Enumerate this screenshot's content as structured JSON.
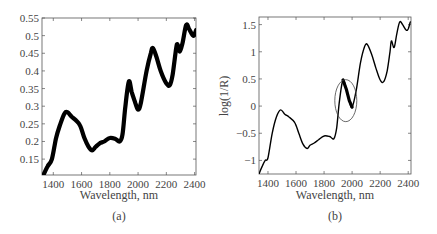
{
  "chart_data": [
    {
      "type": "line",
      "panel": "(a)",
      "title": "",
      "xlabel": "Wavelength, nm",
      "ylabel": "",
      "xlim": [
        1320,
        2410
      ],
      "ylim": [
        0.105,
        0.55
      ],
      "xticks": [
        1400,
        1600,
        1800,
        2000,
        2200,
        2400
      ],
      "yticks": [
        0.15,
        0.2,
        0.25,
        0.3,
        0.35,
        0.4,
        0.45,
        0.5,
        0.55
      ],
      "ytick_labels": [
        "0.15",
        "0.2",
        "0.25",
        "0.3",
        "0.35",
        "0.4",
        "0.45",
        "0.5",
        "0.55"
      ],
      "grid": false,
      "legend": null,
      "series": [
        {
          "name": "spectra (overlaid, many samples)",
          "color": "#000000",
          "band_width": 0.012,
          "x": [
            1330,
            1360,
            1390,
            1420,
            1450,
            1480,
            1500,
            1530,
            1560,
            1590,
            1620,
            1650,
            1675,
            1700,
            1730,
            1760,
            1800,
            1840,
            1870,
            1890,
            1910,
            1935,
            1955,
            1980,
            2000,
            2020,
            2060,
            2090,
            2105,
            2130,
            2160,
            2200,
            2225,
            2245,
            2270,
            2280,
            2295,
            2315,
            2340,
            2360,
            2380,
            2395,
            2410
          ],
          "values": [
            0.105,
            0.13,
            0.15,
            0.21,
            0.25,
            0.28,
            0.283,
            0.27,
            0.26,
            0.245,
            0.21,
            0.185,
            0.175,
            0.185,
            0.195,
            0.2,
            0.21,
            0.207,
            0.2,
            0.22,
            0.3,
            0.37,
            0.34,
            0.31,
            0.29,
            0.31,
            0.4,
            0.45,
            0.465,
            0.44,
            0.4,
            0.365,
            0.36,
            0.39,
            0.465,
            0.475,
            0.455,
            0.48,
            0.53,
            0.52,
            0.505,
            0.5,
            0.515
          ]
        }
      ]
    },
    {
      "type": "line",
      "panel": "(b)",
      "title": "",
      "xlabel": "Wavelength, nm",
      "ylabel": "log(1/R)",
      "xlim": [
        1336,
        2420
      ],
      "ylim": [
        -1.25,
        1.64
      ],
      "xticks": [
        1400,
        1600,
        1800,
        2000,
        2200,
        2400
      ],
      "yticks": [
        -1,
        -0.5,
        0,
        0.5,
        1,
        1.5
      ],
      "ytick_labels": [
        "−1",
        "−0.5",
        "0",
        "0.5",
        "1",
        "1.5"
      ],
      "grid": false,
      "legend": null,
      "annotation": {
        "type": "ellipse",
        "center_wavelength": 1955,
        "center_value": 0.1,
        "note": "highlighted region of spectral variation near 1940 nm"
      },
      "series": [
        {
          "name": "spectra",
          "color": "#000000",
          "x": [
            1336,
            1360,
            1380,
            1400,
            1430,
            1460,
            1490,
            1520,
            1550,
            1590,
            1620,
            1650,
            1680,
            1700,
            1730,
            1760,
            1800,
            1840,
            1870,
            1890,
            1910,
            1935,
            1960,
            1980,
            2000,
            2030,
            2060,
            2090,
            2110,
            2140,
            2170,
            2200,
            2225,
            2250,
            2270,
            2280,
            2300,
            2320,
            2340,
            2360,
            2385,
            2400,
            2415
          ],
          "values": [
            -1.25,
            -1.1,
            -1.0,
            -0.95,
            -0.5,
            -0.2,
            -0.07,
            -0.15,
            -0.2,
            -0.3,
            -0.5,
            -0.7,
            -0.78,
            -0.72,
            -0.68,
            -0.62,
            -0.55,
            -0.56,
            -0.6,
            -0.4,
            0.1,
            0.48,
            0.3,
            0.1,
            -0.02,
            0.3,
            0.8,
            1.1,
            1.13,
            0.95,
            0.7,
            0.48,
            0.45,
            0.65,
            1.0,
            1.2,
            1.08,
            1.35,
            1.55,
            1.5,
            1.4,
            1.42,
            1.55
          ]
        }
      ]
    }
  ],
  "panels": {
    "a": {
      "caption": "(a)",
      "xlabel": "Wavelength, nm"
    },
    "b": {
      "caption": "(b)",
      "xlabel": "Wavelength, nm",
      "ylabel": "log(1/R)"
    }
  }
}
